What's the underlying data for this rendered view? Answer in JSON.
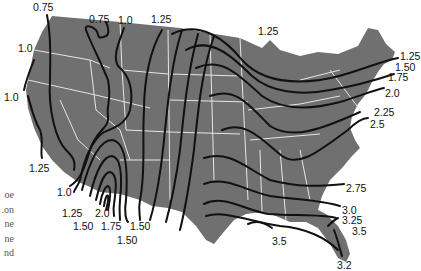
{
  "map": {
    "region": "Contiguous United States",
    "land_color": "#707070",
    "border_color": "#e8e8e8",
    "contour_color": "#111111",
    "contour_labels": [
      {
        "id": "w1",
        "value": "0.75",
        "x": 33,
        "y": 2
      },
      {
        "id": "w2",
        "value": "0.75",
        "x": 89,
        "y": 14
      },
      {
        "id": "w3",
        "value": "1.0",
        "x": 118,
        "y": 15
      },
      {
        "id": "w4",
        "value": "1.25",
        "x": 151,
        "y": 14
      },
      {
        "id": "w5",
        "value": "1.0",
        "x": 18,
        "y": 43
      },
      {
        "id": "w6",
        "value": "1.0",
        "x": 4,
        "y": 92
      },
      {
        "id": "w7",
        "value": "1.25",
        "x": 29,
        "y": 163
      },
      {
        "id": "sw1",
        "value": "1.0",
        "x": 57,
        "y": 187
      },
      {
        "id": "sw2",
        "value": "1.25",
        "x": 62,
        "y": 208
      },
      {
        "id": "sw3",
        "value": "2.0",
        "x": 95,
        "y": 208
      },
      {
        "id": "sw4",
        "value": "1.50",
        "x": 73,
        "y": 221
      },
      {
        "id": "sw5",
        "value": "1.75",
        "x": 101,
        "y": 221
      },
      {
        "id": "sw6",
        "value": "1.50",
        "x": 130,
        "y": 221
      },
      {
        "id": "sw7",
        "value": "1.50",
        "x": 117,
        "y": 235
      },
      {
        "id": "n1",
        "value": "1.25",
        "x": 258,
        "y": 26
      },
      {
        "id": "e1",
        "value": "1.25",
        "x": 400,
        "y": 51
      },
      {
        "id": "e2",
        "value": "1.50",
        "x": 395,
        "y": 62
      },
      {
        "id": "e3",
        "value": "1.75",
        "x": 388,
        "y": 72
      },
      {
        "id": "e4",
        "value": "2.0",
        "x": 385,
        "y": 88
      },
      {
        "id": "e5",
        "value": "2.25",
        "x": 374,
        "y": 107
      },
      {
        "id": "e6",
        "value": "2.5",
        "x": 370,
        "y": 119
      },
      {
        "id": "e7",
        "value": "2.75",
        "x": 346,
        "y": 183
      },
      {
        "id": "e8",
        "value": "3.0",
        "x": 342,
        "y": 205
      },
      {
        "id": "e9",
        "value": "3.25",
        "x": 342,
        "y": 215
      },
      {
        "id": "e10",
        "value": "3.5",
        "x": 352,
        "y": 226
      },
      {
        "id": "g1",
        "value": "3.5",
        "x": 272,
        "y": 236
      },
      {
        "id": "f1",
        "value": "3.2",
        "x": 337,
        "y": 260
      }
    ]
  },
  "side_text": {
    "fragments": [
      "oe",
      "on.",
      "ne",
      "ne",
      "nd"
    ]
  }
}
